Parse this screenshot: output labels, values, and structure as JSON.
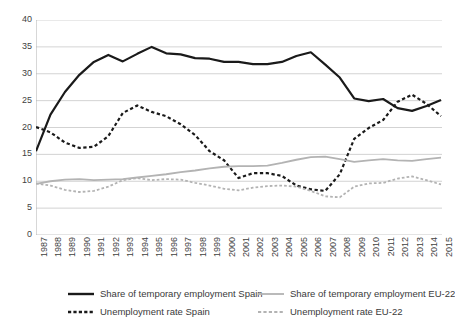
{
  "chart_data": {
    "type": "line",
    "title": "",
    "xlabel": "",
    "ylabel": "",
    "ylim": [
      0,
      40
    ],
    "y_ticks": [
      0,
      5,
      10,
      15,
      20,
      25,
      30,
      35,
      40
    ],
    "grid": "horizontal",
    "legend_position": "bottom",
    "x": [
      1987,
      1988,
      1989,
      1990,
      1991,
      1992,
      1993,
      1994,
      1995,
      1996,
      1997,
      1998,
      1999,
      2000,
      2001,
      2002,
      2003,
      2004,
      2005,
      2006,
      2007,
      2008,
      2009,
      2010,
      2011,
      2012,
      2013,
      2014,
      2015
    ],
    "x_tick_labels": [
      "1987",
      "1988",
      "1989",
      "1990",
      "1991",
      "1992",
      "1993",
      "1994",
      "1995",
      "1996",
      "1997",
      "1998",
      "1999",
      "2000",
      "2001",
      "2002",
      "2003",
      "2004",
      "2005",
      "2006",
      "2007",
      "2008",
      "2009",
      "2010",
      "2011",
      "2012",
      "2013",
      "2014",
      "2015"
    ],
    "series": [
      {
        "name": "Share of temporary employment Spain",
        "style": "solid",
        "color": "#1a1a1a",
        "width": 2.2,
        "values": [
          15.6,
          22.4,
          26.6,
          29.8,
          32.2,
          33.5,
          32.3,
          33.7,
          35.0,
          33.8,
          33.6,
          32.9,
          32.8,
          32.2,
          32.2,
          31.8,
          31.8,
          32.2,
          33.3,
          34.0,
          31.7,
          29.3,
          25.4,
          24.9,
          25.3,
          23.6,
          23.1,
          24.0,
          25.1
        ]
      },
      {
        "name": "Unemployment rate Spain",
        "style": "dashed",
        "color": "#1a1a1a",
        "width": 2.2,
        "values": [
          20.1,
          19.1,
          17.2,
          16.2,
          16.4,
          18.4,
          22.7,
          24.1,
          22.9,
          22.1,
          20.6,
          18.6,
          15.6,
          13.9,
          10.6,
          11.5,
          11.5,
          11.0,
          9.2,
          8.5,
          8.2,
          11.3,
          17.9,
          19.9,
          21.4,
          24.8,
          26.1,
          24.4,
          22.1
        ]
      },
      {
        "name": "Share of temporary employment EU-22",
        "style": "solid",
        "color": "#b3b3b3",
        "width": 1.8,
        "values": [
          9.5,
          10.0,
          10.3,
          10.4,
          10.2,
          10.3,
          10.4,
          10.7,
          11.0,
          11.3,
          11.7,
          12.0,
          12.4,
          12.7,
          12.8,
          12.8,
          12.9,
          13.4,
          14.0,
          14.5,
          14.6,
          14.1,
          13.6,
          13.9,
          14.1,
          13.9,
          13.8,
          14.1,
          14.4
        ]
      },
      {
        "name": "Unemployment rate EU-22",
        "style": "dashed",
        "color": "#b3b3b3",
        "width": 1.8,
        "values": [
          9.6,
          9.2,
          8.4,
          8.0,
          8.2,
          9.0,
          10.2,
          10.6,
          10.2,
          10.4,
          10.3,
          9.7,
          9.2,
          8.6,
          8.3,
          8.8,
          9.1,
          9.2,
          9.0,
          8.2,
          7.2,
          7.0,
          9.0,
          9.6,
          9.7,
          10.5,
          10.9,
          10.2,
          9.4
        ]
      }
    ]
  },
  "legend": {
    "items": [
      {
        "label": "Share of temporary employment Spain",
        "style": "solid",
        "color": "#1a1a1a"
      },
      {
        "label": "Unemployment rate Spain",
        "style": "dashed",
        "color": "#1a1a1a"
      },
      {
        "label": "Share of temporary employment EU-22",
        "style": "solid",
        "color": "#b3b3b3"
      },
      {
        "label": "Unemployment rate EU-22",
        "style": "dashed",
        "color": "#b3b3b3"
      }
    ]
  },
  "colors": {
    "spain": "#1a1a1a",
    "eu22": "#b3b3b3",
    "grid": "#c8c8c8",
    "axis": "#b0b0b0",
    "text": "#3f3f3f"
  }
}
